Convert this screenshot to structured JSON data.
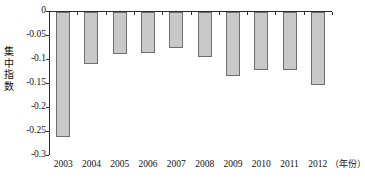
{
  "chart_data": {
    "type": "bar",
    "title": "",
    "xlabel": "（年份）",
    "ylabel": "集中指数",
    "categories": [
      "2003",
      "2004",
      "2005",
      "2006",
      "2007",
      "2008",
      "2009",
      "2010",
      "2011",
      "2012"
    ],
    "values": [
      -0.26,
      -0.108,
      -0.088,
      -0.086,
      -0.074,
      -0.094,
      -0.133,
      -0.12,
      -0.12,
      -0.152
    ],
    "ylim": [
      -0.3,
      0
    ],
    "ytick_labels": [
      "0",
      "-0.05",
      "-0.1",
      "-0.15",
      "-0.2",
      "-0.25",
      "-0.3"
    ],
    "ytick_values": [
      0,
      -0.05,
      -0.1,
      -0.15,
      -0.2,
      -0.25,
      -0.3
    ],
    "grid": false,
    "legend": null,
    "bar_fill_color": "#c9c9c9",
    "bar_border_color": "#6e6e6e",
    "axis_color": "#2b2b2b"
  }
}
